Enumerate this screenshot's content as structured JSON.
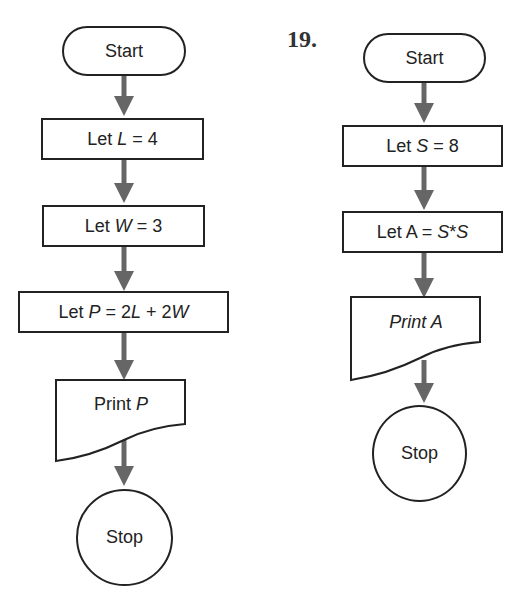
{
  "problem_number": "19.",
  "flowcharts": [
    {
      "name": "perimeter-flowchart",
      "steps": [
        {
          "type": "terminal",
          "label": "Start"
        },
        {
          "type": "process",
          "label": "Let L = 4"
        },
        {
          "type": "process",
          "label": "Let W = 3"
        },
        {
          "type": "process",
          "label": "Let P = 2L + 2W"
        },
        {
          "type": "output",
          "label": "Print P"
        },
        {
          "type": "terminal-circle",
          "label": "Stop"
        }
      ]
    },
    {
      "name": "area-flowchart",
      "steps": [
        {
          "type": "terminal",
          "label": "Start"
        },
        {
          "type": "process",
          "label": "Let S = 8"
        },
        {
          "type": "process",
          "label": "Let A = S*S"
        },
        {
          "type": "output",
          "label": "Print A"
        },
        {
          "type": "terminal-circle",
          "label": "Stop"
        }
      ]
    }
  ],
  "colors": {
    "stroke": "#222222",
    "arrow": "#666666",
    "background": "#ffffff"
  }
}
